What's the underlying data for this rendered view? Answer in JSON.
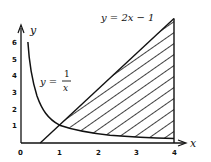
{
  "figure": {
    "axes": {
      "x_label": "x",
      "y_label": "y",
      "origin_label": "0",
      "x_ticks": [
        "1",
        "2",
        "3",
        "4"
      ],
      "y_ticks": [
        "1",
        "2",
        "3",
        "4",
        "5",
        "6"
      ]
    },
    "curves": {
      "line_label": "y = 2x − 1",
      "hyperbola_label_lhs": "y =",
      "hyperbola_label_num": "1",
      "hyperbola_label_den": "x"
    },
    "shaded_region": {
      "bounds": [
        "y = 2x - 1",
        "y = 1/x",
        "x = 4"
      ],
      "intersection": "(1, 1)",
      "fill": "hatched"
    },
    "colors": {
      "ink": "#111111",
      "background": "#ffffff"
    }
  }
}
